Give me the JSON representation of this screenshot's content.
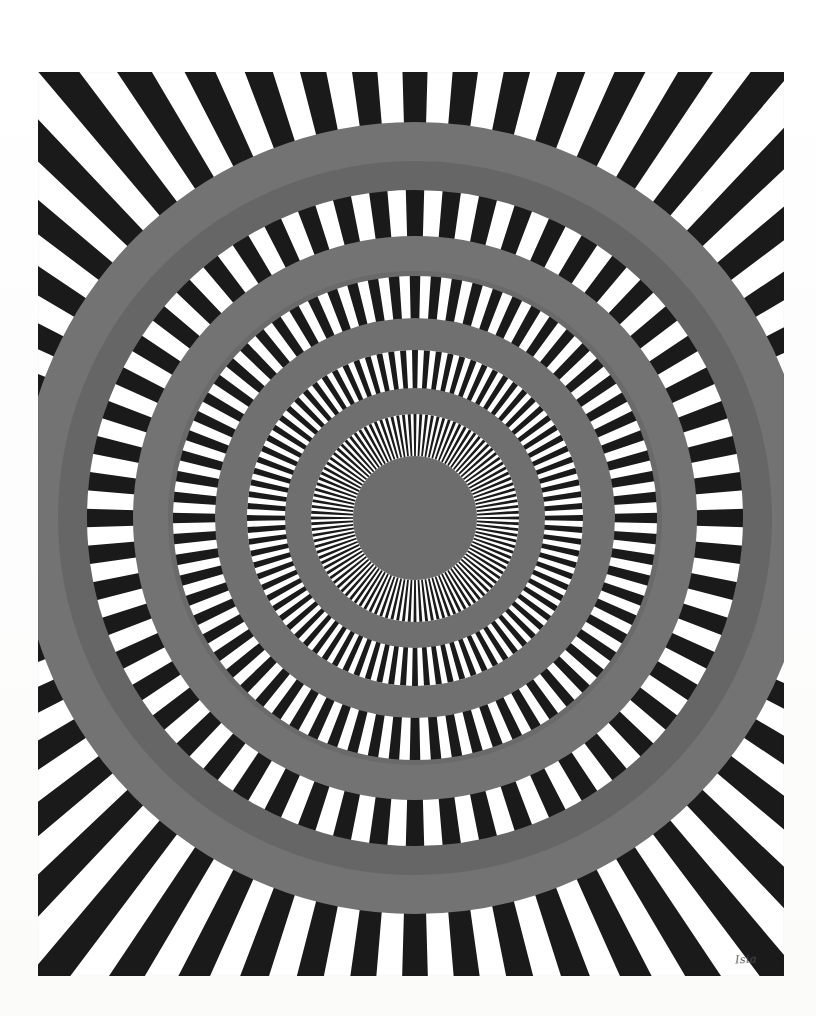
{
  "artwork": {
    "title": "Concentric radial op-art print",
    "medium_appearance": "screenprint on white paper",
    "signature_text": "Isia",
    "paper": {
      "width": 816,
      "height": 1016,
      "color": "#ffffff"
    },
    "image_area": {
      "left": 38,
      "top": 72,
      "width": 746,
      "height": 904,
      "color_background": "#ffffff"
    },
    "center": {
      "x": 415,
      "y": 518
    },
    "palette": {
      "black": "#1a1a1a",
      "white": "#ffffff",
      "gray_light": "#737373",
      "gray_dark": "#666666",
      "gray_center": "#6d6d6d",
      "signature_ink": "#3a3a3a"
    },
    "ray_bands": [
      {
        "name": "band-outer",
        "ray_count": 112,
        "inner_radius": 392,
        "outer_radius": 700
      },
      {
        "name": "band-second",
        "ray_count": 112,
        "inner_radius": 280,
        "outer_radius": 330
      },
      {
        "name": "band-third",
        "ray_count": 144,
        "inner_radius": 198,
        "outer_radius": 244
      },
      {
        "name": "band-fourth",
        "ray_count": 176,
        "inner_radius": 128,
        "outer_radius": 168
      },
      {
        "name": "band-inner",
        "ray_count": 224,
        "inner_radius": 62,
        "outer_radius": 104
      }
    ],
    "gray_rings": [
      {
        "name": "ring-1-outer-light",
        "inner_radius": 356,
        "outer_radius": 396,
        "color": "#737373"
      },
      {
        "name": "ring-1-outer-dark",
        "inner_radius": 328,
        "outer_radius": 357,
        "color": "#666666"
      },
      {
        "name": "ring-2-light",
        "inner_radius": 246,
        "outer_radius": 282,
        "color": "#737373"
      },
      {
        "name": "ring-2-dark",
        "inner_radius": 242,
        "outer_radius": 247,
        "color": "#6a6a6a"
      },
      {
        "name": "ring-3-light",
        "inner_radius": 168,
        "outer_radius": 200,
        "color": "#707070"
      },
      {
        "name": "ring-4-light",
        "inner_radius": 104,
        "outer_radius": 130,
        "color": "#6f6f6f"
      }
    ],
    "center_disc": {
      "radius": 62,
      "color": "#6d6d6d"
    }
  }
}
